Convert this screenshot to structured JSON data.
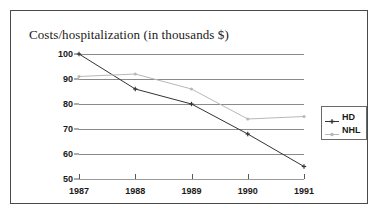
{
  "chart_data": {
    "type": "line",
    "title": "Costs/hospitalization (in thousands $)",
    "xlabel": "",
    "ylabel": "",
    "categories": [
      "1987",
      "1988",
      "1989",
      "1990",
      "1991"
    ],
    "x": [
      1987,
      1988,
      1989,
      1990,
      1991
    ],
    "ylim": [
      50,
      100
    ],
    "yticks": [
      50,
      60,
      70,
      80,
      90,
      100
    ],
    "ytick_labels": [
      "50",
      "60",
      "70",
      "80",
      "90",
      "100"
    ],
    "grid": true,
    "legend_position": "right",
    "series": [
      {
        "name": "HD",
        "color": "#333333",
        "marker": "cross",
        "values": [
          100,
          86,
          80,
          68,
          55
        ]
      },
      {
        "name": "NHL",
        "color": "#b8b8b8",
        "marker": "dot",
        "values": [
          91,
          92,
          86,
          74,
          75
        ]
      }
    ]
  },
  "legend": {
    "items": [
      {
        "label": "HD"
      },
      {
        "label": "NHL"
      }
    ]
  }
}
